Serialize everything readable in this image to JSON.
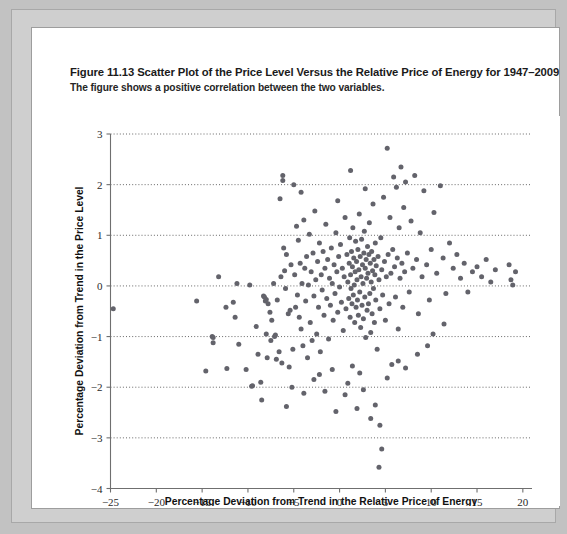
{
  "figure": {
    "number_label": "Figure 11.13",
    "title": "Scatter Plot of the Price Level Versus the Relative Price of Energy for 1947–2009",
    "subtitle": "The figure shows a positive correlation between the two variables."
  },
  "colors": {
    "page_background": "#c2c2c2",
    "card_background": "#ffffff",
    "marker": "#63636b",
    "axis": "#6f6f6f",
    "gridline": "#575757"
  },
  "chart_data": {
    "type": "scatter",
    "title": "Scatter Plot of the Price Level Versus the Relative Price of Energy for 1947–2009",
    "xlabel": "Percentage Deviation from Trend in the Relative Price of Energy",
    "ylabel": "Percentage Deviation from Trend in the Price Level",
    "xlim": [
      -25,
      21
    ],
    "ylim": [
      -4,
      3
    ],
    "xticks": [
      -25,
      -20,
      -15,
      -10,
      -5,
      0,
      5,
      10,
      15,
      20
    ],
    "xticklabels": [
      "−25",
      "−20",
      "−15",
      "−10",
      "−5",
      "0",
      "5",
      "10",
      "15",
      "20"
    ],
    "yticks": [
      -4,
      -3,
      -2,
      -1,
      0,
      1,
      2,
      3
    ],
    "yticklabels": [
      "−4",
      "−3",
      "−2",
      "−1",
      "0",
      "1",
      "2",
      "3"
    ],
    "grid": "horizontal-dotted",
    "gridlines_y": [
      -3,
      -2,
      -1,
      0,
      1,
      2,
      3
    ],
    "legend": null,
    "marker_size_px": 5,
    "n_points": 252,
    "points": [
      [
        -24.7,
        -0.45
      ],
      [
        -15.6,
        -0.3
      ],
      [
        -14.6,
        -1.68
      ],
      [
        -13.9,
        -1.0
      ],
      [
        -13.8,
        -1.02
      ],
      [
        -13.8,
        -1.12
      ],
      [
        -12.4,
        -0.42
      ],
      [
        -12.3,
        -1.63
      ],
      [
        -11.6,
        -0.32
      ],
      [
        -11.4,
        -0.62
      ],
      [
        -11.0,
        -1.15
      ],
      [
        -10.2,
        -1.65
      ],
      [
        -9.6,
        -1.98
      ],
      [
        -9.5,
        -1.97
      ],
      [
        -9.1,
        -0.8
      ],
      [
        -8.9,
        -1.35
      ],
      [
        -8.6,
        -1.9
      ],
      [
        -8.5,
        -2.25
      ],
      [
        -8.3,
        -0.2
      ],
      [
        -8.2,
        -0.22
      ],
      [
        -8.1,
        -0.3
      ],
      [
        -8.0,
        -0.27
      ],
      [
        -8.0,
        -0.95
      ],
      [
        -7.9,
        -1.42
      ],
      [
        -7.8,
        -0.35
      ],
      [
        -7.6,
        -0.52
      ],
      [
        -7.5,
        -1.08
      ],
      [
        -7.4,
        -0.68
      ],
      [
        -7.2,
        0.05
      ],
      [
        -7.1,
        -1.0
      ],
      [
        -7.0,
        -0.97
      ],
      [
        -6.9,
        -1.45
      ],
      [
        -6.8,
        -0.28
      ],
      [
        -6.6,
        -1.3
      ],
      [
        -6.4,
        0.18
      ],
      [
        -6.3,
        -1.52
      ],
      [
        -6.2,
        2.08
      ],
      [
        -6.2,
        2.18
      ],
      [
        -6.1,
        0.75
      ],
      [
        -6.0,
        0.3
      ],
      [
        -5.9,
        -0.05
      ],
      [
        -5.8,
        0.62
      ],
      [
        -5.6,
        -0.55
      ],
      [
        -5.5,
        -1.6
      ],
      [
        -5.4,
        -0.48
      ],
      [
        -5.3,
        0.42
      ],
      [
        -5.2,
        -2.0
      ],
      [
        -5.1,
        -1.25
      ],
      [
        -5.0,
        2.0
      ],
      [
        -4.9,
        0.22
      ],
      [
        -4.8,
        -0.42
      ],
      [
        -4.7,
        1.18
      ],
      [
        -4.6,
        -0.18
      ],
      [
        -4.5,
        0.9
      ],
      [
        -4.4,
        -0.62
      ],
      [
        -4.3,
        0.45
      ],
      [
        -4.2,
        -0.85
      ],
      [
        -4.1,
        0.05
      ],
      [
        -4.0,
        -1.18
      ],
      [
        -3.9,
        1.3
      ],
      [
        -3.8,
        0.35
      ],
      [
        -3.7,
        -0.3
      ],
      [
        -3.6,
        0.58
      ],
      [
        -3.5,
        -1.42
      ],
      [
        -3.4,
        0.02
      ],
      [
        -3.3,
        1.02
      ],
      [
        -3.2,
        -0.72
      ],
      [
        -3.1,
        0.28
      ],
      [
        -3.0,
        -1.08
      ],
      [
        -2.9,
        0.65
      ],
      [
        -2.8,
        -0.2
      ],
      [
        -2.7,
        1.48
      ],
      [
        -2.6,
        0.12
      ],
      [
        -2.5,
        -0.95
      ],
      [
        -2.4,
        0.48
      ],
      [
        -2.3,
        -0.42
      ],
      [
        -2.2,
        0.85
      ],
      [
        -2.1,
        -1.3
      ],
      [
        -2.0,
        0.22
      ],
      [
        -1.9,
        -0.08
      ],
      [
        -1.8,
        0.68
      ],
      [
        -1.7,
        -0.58
      ],
      [
        -1.6,
        0.35
      ],
      [
        -1.5,
        1.22
      ],
      [
        -1.4,
        -0.25
      ],
      [
        -1.3,
        0.52
      ],
      [
        -1.2,
        -1.05
      ],
      [
        -1.1,
        0.15
      ],
      [
        -1.0,
        -0.38
      ],
      [
        -0.9,
        0.75
      ],
      [
        -0.8,
        0.05
      ],
      [
        -0.7,
        -0.68
      ],
      [
        -0.6,
        0.42
      ],
      [
        -0.5,
        -0.15
      ],
      [
        -0.4,
        1.05
      ],
      [
        -0.3,
        0.28
      ],
      [
        -0.2,
        -0.52
      ],
      [
        -0.1,
        0.58
      ],
      [
        0.0,
        -0.02
      ],
      [
        0.1,
        0.82
      ],
      [
        0.2,
        -0.32
      ],
      [
        0.3,
        0.35
      ],
      [
        0.4,
        -0.88
      ],
      [
        0.5,
        0.18
      ],
      [
        0.6,
        1.35
      ],
      [
        0.7,
        -0.45
      ],
      [
        0.8,
        0.62
      ],
      [
        0.9,
        0.08
      ],
      [
        1.0,
        -0.25
      ],
      [
        1.05,
        0.45
      ],
      [
        1.1,
        0.95
      ],
      [
        1.15,
        -0.62
      ],
      [
        1.2,
        0.22
      ],
      [
        1.25,
        -0.05
      ],
      [
        1.3,
        0.68
      ],
      [
        1.35,
        -0.35
      ],
      [
        1.4,
        0.38
      ],
      [
        1.45,
        1.15
      ],
      [
        1.5,
        -0.18
      ],
      [
        1.55,
        0.55
      ],
      [
        1.6,
        0.02
      ],
      [
        1.65,
        -0.72
      ],
      [
        1.7,
        0.28
      ],
      [
        1.75,
        0.88
      ],
      [
        1.8,
        -0.42
      ],
      [
        1.85,
        0.48
      ],
      [
        1.9,
        0.12
      ],
      [
        1.95,
        -0.28
      ],
      [
        2.0,
        0.72
      ],
      [
        2.05,
        -0.58
      ],
      [
        2.1,
        0.32
      ],
      [
        2.15,
        1.42
      ],
      [
        2.2,
        -0.12
      ],
      [
        2.25,
        0.58
      ],
      [
        2.3,
        -0.82
      ],
      [
        2.35,
        0.18
      ],
      [
        2.4,
        0.92
      ],
      [
        2.45,
        -0.38
      ],
      [
        2.5,
        0.42
      ],
      [
        2.55,
        0.05
      ],
      [
        2.6,
        -0.65
      ],
      [
        2.65,
        0.65
      ],
      [
        2.7,
        1.08
      ],
      [
        2.75,
        -0.22
      ],
      [
        2.8,
        0.35
      ],
      [
        2.85,
        -1.02
      ],
      [
        2.9,
        0.52
      ],
      [
        2.95,
        0.15
      ],
      [
        3.0,
        -0.48
      ],
      [
        3.05,
        0.78
      ],
      [
        3.1,
        0.25
      ],
      [
        3.15,
        -0.35
      ],
      [
        3.2,
        0.62
      ],
      [
        3.25,
        1.25
      ],
      [
        3.3,
        -0.15
      ],
      [
        3.35,
        0.45
      ],
      [
        3.4,
        -0.92
      ],
      [
        3.45,
        0.08
      ],
      [
        3.5,
        0.68
      ],
      [
        3.55,
        -0.55
      ],
      [
        3.6,
        0.3
      ],
      [
        3.65,
        1.62
      ],
      [
        3.7,
        -0.05
      ],
      [
        3.75,
        0.52
      ],
      [
        3.8,
        -0.72
      ],
      [
        3.85,
        0.22
      ],
      [
        3.9,
        0.85
      ],
      [
        3.95,
        -0.28
      ],
      [
        4.0,
        0.4
      ],
      [
        4.1,
        -1.25
      ],
      [
        4.2,
        0.58
      ],
      [
        4.3,
        0.12
      ],
      [
        4.4,
        -0.45
      ],
      [
        4.5,
        0.95
      ],
      [
        4.6,
        0.32
      ],
      [
        4.7,
        -0.18
      ],
      [
        4.8,
        1.75
      ],
      [
        4.9,
        0.48
      ],
      [
        5.0,
        -0.68
      ],
      [
        5.1,
        0.18
      ],
      [
        5.2,
        2.72
      ],
      [
        5.3,
        0.62
      ],
      [
        5.4,
        -0.35
      ],
      [
        5.5,
        1.35
      ],
      [
        5.6,
        0.25
      ],
      [
        5.7,
        -1.55
      ],
      [
        5.8,
        0.72
      ],
      [
        5.9,
        2.15
      ],
      [
        6.0,
        0.38
      ],
      [
        6.1,
        -0.22
      ],
      [
        6.2,
        1.95
      ],
      [
        6.3,
        0.55
      ],
      [
        6.4,
        -0.85
      ],
      [
        6.5,
        1.15
      ],
      [
        6.6,
        0.15
      ],
      [
        6.7,
        2.35
      ],
      [
        6.8,
        0.45
      ],
      [
        6.9,
        -0.42
      ],
      [
        7.0,
        1.55
      ],
      [
        7.1,
        0.28
      ],
      [
        7.2,
        2.05
      ],
      [
        7.4,
        0.65
      ],
      [
        7.6,
        -0.12
      ],
      [
        7.8,
        1.28
      ],
      [
        8.0,
        0.35
      ],
      [
        8.2,
        2.18
      ],
      [
        8.4,
        0.52
      ],
      [
        8.6,
        -0.55
      ],
      [
        8.8,
        1.05
      ],
      [
        9.0,
        0.18
      ],
      [
        9.2,
        1.88
      ],
      [
        9.5,
        0.42
      ],
      [
        9.8,
        -0.28
      ],
      [
        10.0,
        0.72
      ],
      [
        10.3,
        1.45
      ],
      [
        10.6,
        0.25
      ],
      [
        11.0,
        1.98
      ],
      [
        11.3,
        0.55
      ],
      [
        11.6,
        -0.15
      ],
      [
        12.0,
        0.85
      ],
      [
        12.4,
        0.35
      ],
      [
        12.8,
        0.62
      ],
      [
        13.2,
        0.15
      ],
      [
        13.6,
        0.45
      ],
      [
        14.0,
        -0.12
      ],
      [
        14.5,
        0.28
      ],
      [
        15.0,
        0.38
      ],
      [
        15.5,
        0.18
      ],
      [
        16.0,
        0.52
      ],
      [
        16.5,
        0.08
      ],
      [
        17.0,
        0.32
      ],
      [
        18.5,
        0.42
      ],
      [
        18.7,
        0.12
      ],
      [
        18.9,
        0.02
      ],
      [
        4.6,
        -3.22
      ],
      [
        4.3,
        -3.58
      ],
      [
        4.4,
        -2.75
      ],
      [
        3.4,
        -2.62
      ],
      [
        3.9,
        -2.35
      ],
      [
        2.6,
        -2.05
      ],
      [
        1.9,
        -2.42
      ],
      [
        0.6,
        -2.15
      ],
      [
        -0.4,
        -2.48
      ],
      [
        -1.6,
        -2.08
      ],
      [
        -2.8,
        -1.85
      ],
      [
        -3.9,
        -2.12
      ],
      [
        -5.8,
        -2.38
      ],
      [
        2.2,
        -1.72
      ],
      [
        0.9,
        -1.92
      ],
      [
        -0.8,
        -1.65
      ],
      [
        5.2,
        -1.82
      ],
      [
        6.4,
        -1.48
      ],
      [
        1.4,
        -1.58
      ],
      [
        -2.2,
        -1.75
      ],
      [
        8.5,
        -1.35
      ],
      [
        9.6,
        -1.18
      ],
      [
        7.2,
        -1.62
      ],
      [
        10.2,
        -0.95
      ],
      [
        11.4,
        -0.75
      ],
      [
        -6.5,
        1.72
      ],
      [
        -4.2,
        1.85
      ],
      [
        -0.2,
        1.68
      ],
      [
        1.2,
        2.28
      ],
      [
        2.8,
        1.92
      ],
      [
        19.2,
        0.28
      ],
      [
        -9.8,
        0.02
      ],
      [
        -11.2,
        0.05
      ],
      [
        -13.2,
        0.18
      ]
    ]
  }
}
